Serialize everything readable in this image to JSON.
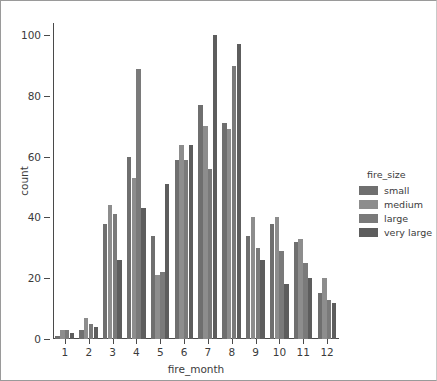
{
  "chart_data": {
    "type": "bar",
    "title": "",
    "xlabel": "fire_month",
    "ylabel": "count",
    "categories": [
      "1",
      "2",
      "3",
      "4",
      "5",
      "6",
      "7",
      "8",
      "9",
      "10",
      "11",
      "12"
    ],
    "xlim": [
      0.5,
      12.5
    ],
    "ylim": [
      0,
      104
    ],
    "yticks": [
      0,
      20,
      40,
      60,
      80,
      100
    ],
    "yticklabels": [
      "0",
      "20",
      "40",
      "60",
      "80",
      "100"
    ],
    "grid": false,
    "legend_title": "fire_size",
    "legend_position": "right-outside",
    "series": [
      {
        "name": "small",
        "color": "#6f6f6f",
        "values": [
          1,
          3,
          38,
          60,
          34,
          59,
          77,
          71,
          34,
          38,
          32,
          15
        ]
      },
      {
        "name": "medium",
        "color": "#8d8d8d",
        "values": [
          3,
          7,
          44,
          53,
          21,
          64,
          70,
          69,
          40,
          40,
          33,
          20
        ]
      },
      {
        "name": "large",
        "color": "#7a7a7a",
        "values": [
          3,
          5,
          41,
          89,
          22,
          59,
          56,
          90,
          30,
          29,
          25,
          13
        ]
      },
      {
        "name": "very large",
        "color": "#5d5d5d",
        "values": [
          2,
          4,
          26,
          43,
          51,
          64,
          100,
          97,
          26,
          18,
          20,
          12
        ]
      }
    ]
  },
  "axes": {
    "y_axis_label": "count",
    "x_axis_label": "fire_month"
  },
  "legend": {
    "title": "fire_size",
    "entries": [
      {
        "label": "small"
      },
      {
        "label": "medium"
      },
      {
        "label": "large"
      },
      {
        "label": "very large"
      }
    ]
  },
  "colors": {
    "axis": "#4a4a4a",
    "text": "#3b3b3b",
    "background": "#ffffff",
    "border": "#9a9a9a"
  }
}
